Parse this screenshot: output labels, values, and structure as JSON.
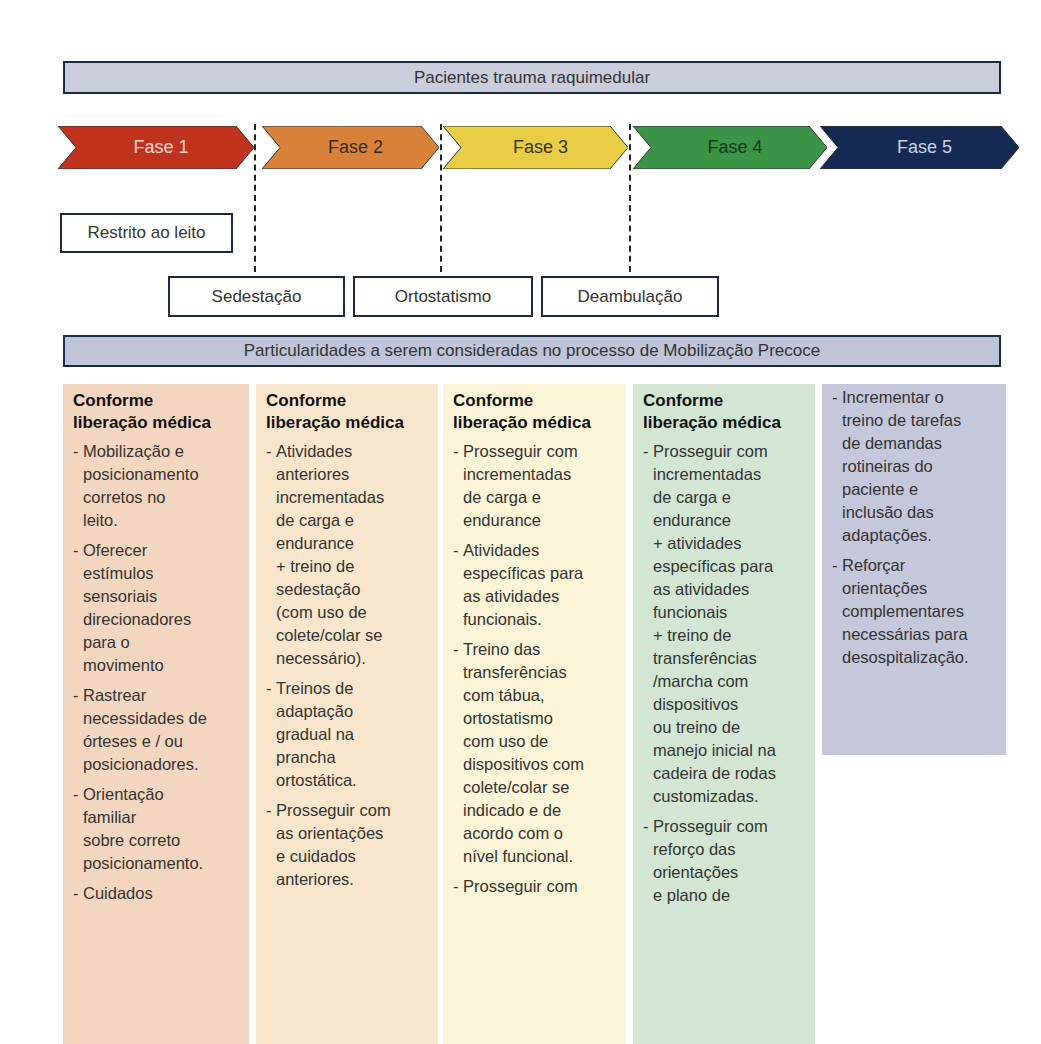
{
  "title_bar": "Pacientes trauma raquimedular",
  "phases": [
    {
      "label": "Fase 1",
      "color": "#c0331f",
      "text_color": "#f3d7cf"
    },
    {
      "label": "Fase 2",
      "color": "#d9833a",
      "text_color": "#3a2a1a"
    },
    {
      "label": "Fase 3",
      "color": "#e8cd45",
      "text_color": "#3a3318"
    },
    {
      "label": "Fase 4",
      "color": "#3b9446",
      "text_color": "#153a1a"
    },
    {
      "label": "Fase 5",
      "color": "#142a52",
      "text_color": "#c9d2e3"
    }
  ],
  "stages": {
    "restricted": "Restrito ao leito",
    "sitting": "Sedestação",
    "standing": "Ortostatismo",
    "walking": "Deambulação"
  },
  "section_bar": "Particularidades a serem consideradas no processo de Mobilização Precoce",
  "columns": [
    {
      "bg": "#f3d6bf",
      "heading": "Conforme\nliberação médica",
      "items": [
        "Mobilização e\nposicionamento\ncorretos no\nleito.",
        "Oferecer\nestímulos\nsensoriais\ndirecionadores\npara o\nmovimento",
        "Rastrear\nnecessidades de\nórteses e / ou\nposicionadores.",
        "Orientação\nfamiliar\nsobre correto\nposicionamento.",
        "Cuidados"
      ]
    },
    {
      "bg": "#f7e6cc",
      "heading": "Conforme\nliberação médica",
      "items": [
        "Atividades\nanteriores\nincrementadas\nde carga e\nendurance\n+ treino de\nsedestação\n(com uso de\ncolete/colar se\nnecessário).",
        "Treinos de\nadaptação\ngradual na\nprancha\nortostática.",
        "Prosseguir com\nas orientações\ne cuidados\nanteriores."
      ]
    },
    {
      "bg": "#fbf4d6",
      "heading": "Conforme\nliberação médica",
      "items": [
        "Prosseguir com\nincrementadas\nde carga e\nendurance",
        "Atividades\nespecíficas para\nas atividades\nfuncionais.",
        "Treino das\ntransferências\ncom tábua,\nortostatismo\ncom uso de\ndispositivos com\ncolete/colar se\nindicado e de\nacordo com o\nnível funcional.",
        "Prosseguir com"
      ]
    },
    {
      "bg": "#d3e6d3",
      "heading": "Conforme\nliberação médica",
      "items": [
        "Prosseguir com\nincrementadas\nde carga e\nendurance\n+ atividades\nespecíficas para\nas atividades\nfuncionais\n+ treino de\ntransferências\n/marcha com\ndispositivos\nou treino de\nmanejo inicial na\ncadeira de rodas\ncustomizadas.",
        "Prosseguir com\nreforço das\norientações\ne plano de"
      ]
    },
    {
      "bg": "#c4c8da",
      "heading": "",
      "items": [
        "Incrementar o\ntreino de tarefas\nde demandas\nrotineiras do\npaciente e\ninclusão das\nadaptações.",
        "Reforçar\norientações\ncomplementares\nnecessárias para\ndesospitalização."
      ]
    }
  ]
}
